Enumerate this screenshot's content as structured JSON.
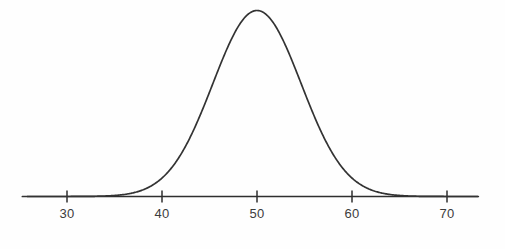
{
  "chart_data": {
    "type": "line",
    "title": "",
    "subtitle": "",
    "xlabel": "",
    "ylabel": "",
    "curve_name": "normal-distribution-curve",
    "distribution": {
      "kind": "normal",
      "mean": 50,
      "sigma": 4.65
    },
    "xlim": [
      25.3,
      73.3
    ],
    "ylim": [
      0,
      1
    ],
    "grid": false,
    "legend": null,
    "axis": {
      "x_tick_values": [
        30,
        40,
        50,
        60,
        70
      ],
      "x_tick_labels": [
        "30",
        "40",
        "50",
        "60",
        "70"
      ],
      "y_axis_visible": false,
      "axis_color": "#2e2e2e",
      "tick_color": "#2e2e2e"
    },
    "series": [
      {
        "name": "Normal density",
        "color": "#333333",
        "x": [
          27.0,
          28.0,
          29.0,
          30.0,
          31.0,
          32.0,
          33.0,
          34.0,
          35.0,
          36.0,
          37.0,
          38.0,
          39.0,
          40.0,
          41.0,
          42.0,
          43.0,
          44.0,
          45.0,
          46.0,
          47.0,
          48.0,
          49.0,
          50.0,
          51.0,
          52.0,
          53.0,
          54.0,
          55.0,
          56.0,
          57.0,
          58.0,
          59.0,
          60.0,
          61.0,
          62.0,
          63.0,
          64.0,
          65.0,
          66.0,
          67.0,
          68.0,
          69.0,
          70.0,
          71.0,
          72.0,
          73.0
        ],
        "y": [
          0.0,
          0.0,
          0.001,
          0.001,
          0.003,
          0.005,
          0.01,
          0.018,
          0.032,
          0.053,
          0.083,
          0.124,
          0.176,
          0.24,
          0.313,
          0.392,
          0.474,
          0.554,
          0.628,
          0.727,
          0.816,
          0.901,
          0.977,
          1.0,
          0.977,
          0.901,
          0.816,
          0.727,
          0.628,
          0.554,
          0.474,
          0.392,
          0.313,
          0.24,
          0.176,
          0.124,
          0.083,
          0.053,
          0.032,
          0.018,
          0.01,
          0.005,
          0.003,
          0.001,
          0.001,
          0.0,
          0.0
        ]
      }
    ],
    "colors": {
      "background": "#fefefe",
      "curve": "#333333",
      "axis": "#2e2e2e",
      "label_text": "#3c3c3c"
    }
  }
}
